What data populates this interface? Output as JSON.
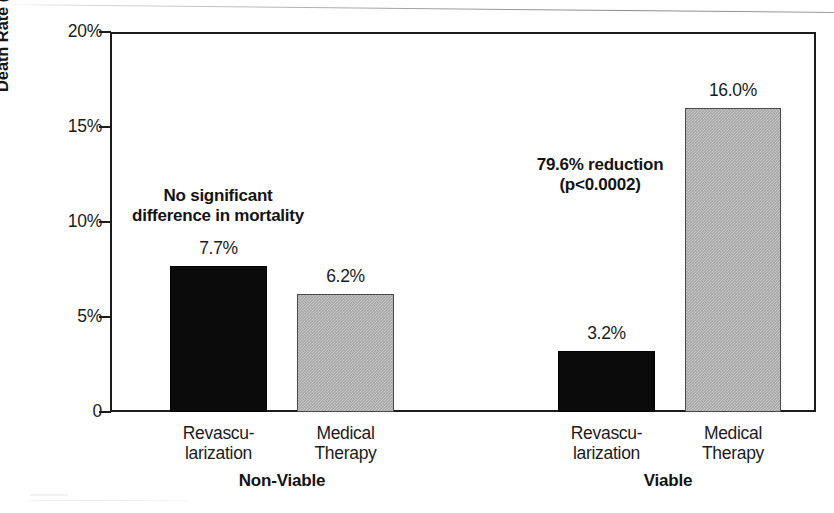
{
  "chart_data": {
    "type": "bar",
    "title": "",
    "xlabel": "",
    "ylabel": "Death Rate (percent per year)",
    "ylim": [
      0,
      20
    ],
    "yunit": "%",
    "grid": false,
    "legend": "none",
    "y_ticks": [
      {
        "value": 0,
        "label": "0"
      },
      {
        "value": 5,
        "label": "5%"
      },
      {
        "value": 10,
        "label": "10%"
      },
      {
        "value": 15,
        "label": "15%"
      },
      {
        "value": 20,
        "label": "20%"
      }
    ],
    "groups": [
      {
        "name": "Non-Viable",
        "label": "Non-Viable",
        "annotation": "No significant\ndifference in mortality",
        "bars": [
          {
            "category": "Revascularization",
            "label": "Revascu-\nlarization",
            "value": 7.7,
            "value_label": "7.7%",
            "fill": "black"
          },
          {
            "category": "Medical Therapy",
            "label": "Medical\nTherapy",
            "value": 6.2,
            "value_label": "6.2%",
            "fill": "gray"
          }
        ]
      },
      {
        "name": "Viable",
        "label": "Viable",
        "annotation": "79.6% reduction\n(p<0.0002)",
        "bars": [
          {
            "category": "Revascularization",
            "label": "Revascu-\nlarization",
            "value": 3.2,
            "value_label": "3.2%",
            "fill": "black"
          },
          {
            "category": "Medical Therapy",
            "label": "Medical\nTherapy",
            "value": 16.0,
            "value_label": "16.0%",
            "fill": "gray"
          }
        ]
      }
    ],
    "categories": [
      "Revascularization",
      "Medical Therapy",
      "Revascularization",
      "Medical Therapy"
    ],
    "values": [
      7.7,
      6.2,
      3.2,
      16.0
    ],
    "colors": {
      "black_bar": "#0b0b0b",
      "gray_bar": "#a9a9a9",
      "axis": "#1b1b1b",
      "text": "#1c1c1c",
      "background": "#ffffff"
    }
  },
  "layout": {
    "plot": {
      "left": 110,
      "top": 32,
      "width": 706,
      "height": 380
    },
    "bars": [
      {
        "x": 170,
        "w": 97
      },
      {
        "x": 297,
        "w": 97
      },
      {
        "x": 558,
        "w": 97
      },
      {
        "x": 685,
        "w": 96
      }
    ],
    "annotations": [
      {
        "x": 218,
        "y": 186
      },
      {
        "x": 600,
        "y": 155
      }
    ],
    "group_labels": [
      {
        "x": 282,
        "y": 472
      },
      {
        "x": 668,
        "y": 472
      }
    ]
  }
}
